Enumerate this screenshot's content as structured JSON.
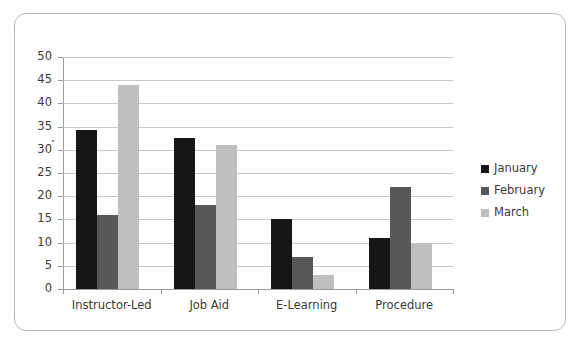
{
  "chart_data": {
    "type": "bar",
    "title": "",
    "subtitle": "",
    "xlabel": "",
    "ylabel": "",
    "categories": [
      "Instructor-Led",
      "Job Aid",
      "E-Learning",
      "Procedure"
    ],
    "series": [
      {
        "name": "January",
        "color": "#161616",
        "values": [
          34.3,
          32.5,
          15.0,
          11.0
        ]
      },
      {
        "name": "February",
        "color": "#585858",
        "values": [
          16.0,
          18.0,
          7.0,
          22.0
        ]
      },
      {
        "name": "March",
        "color": "#bfbfbf",
        "values": [
          44.0,
          31.0,
          3.0,
          10.0
        ]
      }
    ],
    "ylim": [
      0,
      50
    ],
    "ytick_step": 5,
    "ytick_labels": [
      "50",
      "45",
      "40",
      "35",
      "30",
      "25",
      "20",
      "15",
      "10",
      "5",
      "0"
    ],
    "grid": true,
    "grid_axis": "y",
    "legend_position": "right",
    "background_color": "#ffffff",
    "gridline_color": "#c8c8c8",
    "axis_color": "#9a9a9a",
    "frame_border_color": "#b9b9b9"
  }
}
